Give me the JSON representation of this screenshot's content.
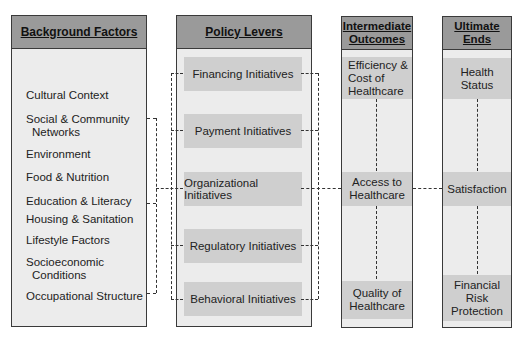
{
  "diagram": {
    "columns": [
      {
        "title": "Background Factors",
        "items": [
          {
            "line1": "Cultural Context",
            "line2": ""
          },
          {
            "line1": "Social & Community",
            "line2": "Networks"
          },
          {
            "line1": "Environment",
            "line2": ""
          },
          {
            "line1": "Food & Nutrition",
            "line2": ""
          },
          {
            "line1": "Education & Literacy",
            "line2": ""
          },
          {
            "line1": "Housing & Sanitation",
            "line2": ""
          },
          {
            "line1": "Lifestyle Factors",
            "line2": ""
          },
          {
            "line1": "Socioeconomic",
            "line2": "Conditions"
          },
          {
            "line1": "Occupational Structure",
            "line2": ""
          }
        ]
      },
      {
        "title": "Policy Levers",
        "items": [
          "Financing Initiatives",
          "Payment Initiatives",
          "Organizational Initiatives",
          "Regulatory Initiatives",
          "Behavioral Initiatives"
        ]
      },
      {
        "title_line1": "Intermediate",
        "title_line2": "Outcomes",
        "items": [
          {
            "lines": [
              "Efficiency &",
              "Cost of",
              "Healthcare"
            ]
          },
          {
            "lines": [
              "Access to",
              "Healthcare"
            ]
          },
          {
            "lines": [
              "Quality of",
              "Healthcare"
            ]
          }
        ]
      },
      {
        "title_line1": "Ultimate",
        "title_line2": "Ends",
        "items": [
          {
            "lines": [
              "Health",
              "Status"
            ]
          },
          {
            "lines": [
              "Satisfaction"
            ]
          },
          {
            "lines": [
              "Financial",
              "Risk",
              "Protection"
            ]
          }
        ]
      }
    ],
    "colors": {
      "header_fill": "#9a9a9a",
      "column_fill": "#ececec",
      "box_fill": "#cfcfcf",
      "border": "#3a3a3a"
    }
  }
}
